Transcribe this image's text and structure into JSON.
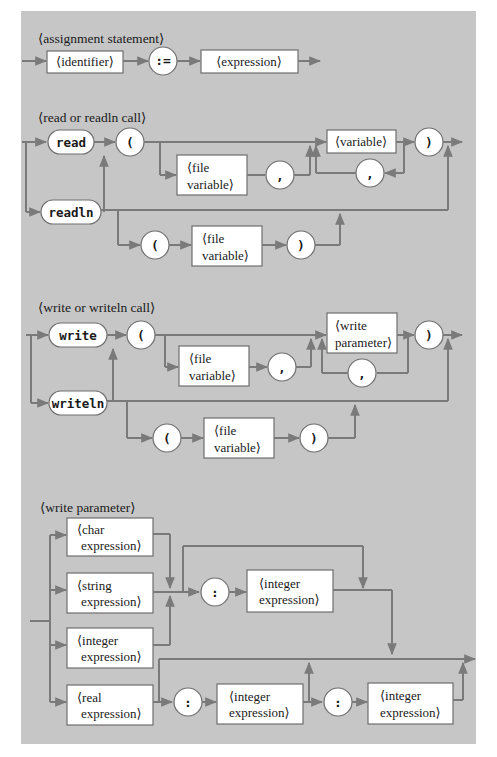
{
  "colors": {
    "panel": "#c6c6c6",
    "line": "#7a7a7a",
    "box": "#ffffff",
    "text": "#1a1a1a"
  },
  "assignment": {
    "title": "⟨assignment statement⟩",
    "identifier": "⟨identifier⟩",
    "assign_op": ":=",
    "expression": "⟨expression⟩"
  },
  "read": {
    "title": "⟨read or readln call⟩",
    "kw_read": "read",
    "kw_readln": "readln",
    "lparen": "(",
    "rparen": ")",
    "comma": ",",
    "file_var_1": "⟨file",
    "file_var_2": "variable⟩",
    "variable": "⟨variable⟩"
  },
  "write": {
    "title": "⟨write or writeln call⟩",
    "kw_write": "write",
    "kw_writeln": "writeln",
    "lparen": "(",
    "rparen": ")",
    "comma": ",",
    "file_var_1": "⟨file",
    "file_var_2": "variable⟩",
    "param_1": "⟨write",
    "param_2": "parameter⟩"
  },
  "param": {
    "title": "⟨write parameter⟩",
    "char_1": "⟨char",
    "string_1": "⟨string",
    "integer_1": "⟨integer",
    "real_1": "⟨real",
    "expr_2": "expression⟩",
    "colon": ":"
  }
}
